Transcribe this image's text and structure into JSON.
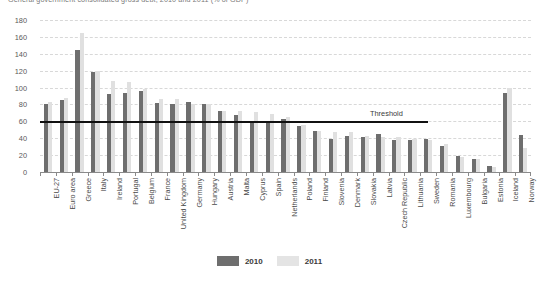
{
  "title": "General government consolidated gross debt, 2010 and 2011 (% of GDP)",
  "legend": {
    "items": [
      {
        "label": "2010",
        "color": "#6e6e6e"
      },
      {
        "label": "2011",
        "color": "#e4e4e4"
      }
    ]
  },
  "annotations": {
    "threshold_label": "Threshold",
    "threshold_value": 60
  },
  "chart_data": {
    "type": "bar",
    "title": "General government consolidated gross debt, 2010 and 2011 (% of GDP)",
    "xlabel": "",
    "ylabel": "",
    "ylim": [
      0,
      180
    ],
    "yticks": [
      0,
      20,
      40,
      60,
      80,
      100,
      120,
      140,
      160,
      180
    ],
    "grid": true,
    "legend_position": "bottom",
    "threshold": 60,
    "threshold_label": "Threshold",
    "categories": [
      "EU-27",
      "Euro area",
      "Greece",
      "Italy",
      "Ireland",
      "Portugal",
      "Belgium",
      "France",
      "United Kingdom",
      "Germany",
      "Hungary",
      "Austria",
      "Malta",
      "Cyprus",
      "Spain",
      "Netherlands",
      "Poland",
      "Finland",
      "Slovenia",
      "Denmark",
      "Slovakia",
      "Latvia",
      "Czech Republic",
      "Lithuania",
      "Sweden",
      "Romania",
      "Luxembourg",
      "Bulgaria",
      "Estonia",
      "Iceland",
      "Norway"
    ],
    "series": [
      {
        "name": "2010",
        "color": "#6e6e6e",
        "values": [
          80,
          85,
          145,
          118,
          92,
          94,
          96,
          82,
          80,
          83,
          81,
          72,
          68,
          61,
          61,
          63,
          55,
          48,
          39,
          43,
          41,
          45,
          38,
          38,
          39,
          31,
          19,
          16,
          7,
          93,
          44
        ]
      },
      {
        "name": "2011",
        "color": "#e0e0e0",
        "values": [
          83,
          88,
          165,
          120,
          108,
          107,
          98,
          86,
          86,
          81,
          81,
          72,
          72,
          71,
          69,
          65,
          56,
          49,
          47,
          47,
          43,
          42,
          41,
          39,
          38,
          33,
          18,
          16,
          6,
          99,
          29
        ]
      }
    ]
  }
}
